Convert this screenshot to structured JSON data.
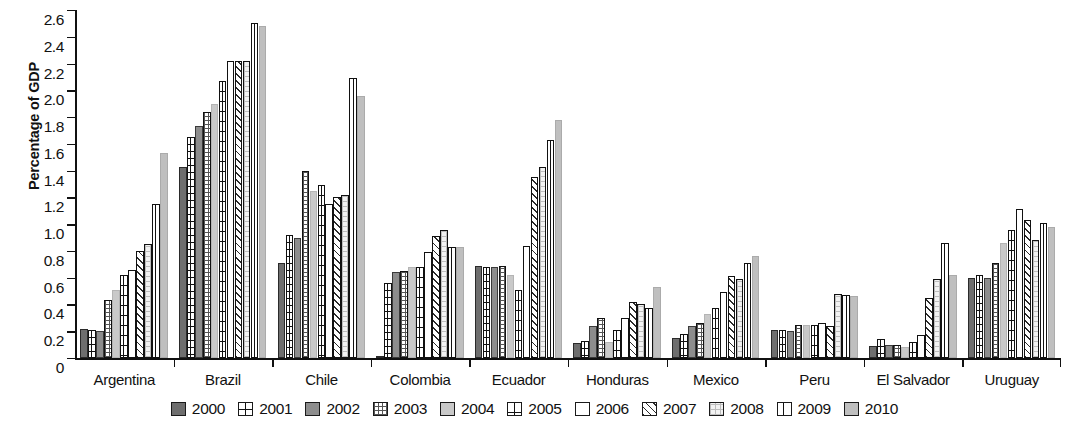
{
  "chart_data": {
    "type": "bar",
    "title": "",
    "xlabel": "",
    "ylabel": "Percentage of GDP",
    "ylim": [
      0,
      2.6
    ],
    "ytick_labels": [
      "2.6",
      "2.4",
      "2.2",
      "2.0",
      "1.8",
      "1.6",
      "1.4",
      "1.2",
      "1.0",
      "0.8",
      "0.6",
      "0.4",
      "0.2",
      "0"
    ],
    "ytick_values": [
      2.6,
      2.4,
      2.2,
      2.0,
      1.8,
      1.6,
      1.4,
      1.2,
      1.0,
      0.8,
      0.6,
      0.4,
      0.2,
      0
    ],
    "grid": false,
    "legend_position": "bottom",
    "categories": [
      "Argentina",
      "Brazil",
      "Chile",
      "Colombia",
      "Ecuador",
      "Honduras",
      "Mexico",
      "Peru",
      "El Salvador",
      "Uruguay"
    ],
    "series": [
      {
        "name": "2000",
        "swatch": "solid-dark-gray",
        "values": [
          0.22,
          1.43,
          0.71,
          0.01,
          0.69,
          0.11,
          0.15,
          0.21,
          0.09,
          0.6
        ]
      },
      {
        "name": "2001",
        "swatch": "horizontal-lines-with-center-vertical",
        "values": [
          0.21,
          1.65,
          0.92,
          0.56,
          0.68,
          0.13,
          0.18,
          0.21,
          0.14,
          0.62
        ]
      },
      {
        "name": "2002",
        "swatch": "solid-medium-gray",
        "values": [
          0.2,
          1.73,
          0.9,
          0.64,
          0.68,
          0.24,
          0.24,
          0.2,
          0.1,
          0.6
        ]
      },
      {
        "name": "2003",
        "swatch": "fine-checker",
        "values": [
          0.43,
          1.84,
          1.4,
          0.65,
          0.69,
          0.3,
          0.26,
          0.25,
          0.1,
          0.71
        ]
      },
      {
        "name": "2004",
        "swatch": "solid-light-gray",
        "values": [
          0.51,
          1.9,
          1.25,
          0.68,
          0.62,
          0.12,
          0.33,
          0.25,
          0.08,
          0.86
        ]
      },
      {
        "name": "2005",
        "swatch": "grid-with-vertical",
        "values": [
          0.62,
          2.07,
          1.29,
          0.68,
          0.51,
          0.21,
          0.37,
          0.25,
          0.12,
          0.96
        ]
      },
      {
        "name": "2006",
        "swatch": "white-outline",
        "values": [
          0.66,
          2.22,
          1.15,
          0.79,
          0.84,
          0.3,
          0.49,
          0.26,
          0.17,
          1.11
        ]
      },
      {
        "name": "2007",
        "swatch": "diagonal-hatch",
        "values": [
          0.8,
          2.22,
          1.2,
          0.91,
          1.35,
          0.42,
          0.61,
          0.24,
          0.45,
          1.03
        ]
      },
      {
        "name": "2008",
        "swatch": "light-checker",
        "values": [
          0.85,
          2.22,
          1.22,
          0.96,
          1.43,
          0.4,
          0.59,
          0.48,
          0.59,
          0.88
        ]
      },
      {
        "name": "2009",
        "swatch": "vertical-split",
        "values": [
          1.15,
          2.5,
          2.09,
          0.83,
          1.63,
          0.37,
          0.71,
          0.47,
          0.86,
          1.01
        ]
      },
      {
        "name": "2010",
        "swatch": "solid-pale-gray",
        "values": [
          1.53,
          2.48,
          1.96,
          0.83,
          1.78,
          0.53,
          0.76,
          0.46,
          0.62,
          0.98
        ]
      }
    ]
  },
  "legend": {
    "items": [
      "2000",
      "2001",
      "2002",
      "2003",
      "2004",
      "2005",
      "2006",
      "2007",
      "2008",
      "2009",
      "2010"
    ]
  }
}
